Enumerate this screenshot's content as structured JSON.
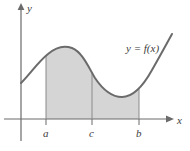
{
  "figure": {
    "name": "area-under-curve-diagram",
    "background_color": "#ffffff",
    "curve_color": "#6b6b6b",
    "axis_color": "#6b6b6b",
    "shade_color": "#d5d5d5",
    "divider_color": "#8a8a8a",
    "label_color": "#3d3d3d"
  },
  "axes": {
    "x_axis_label": "x",
    "y_axis_label": "y",
    "origin": {
      "x": 21,
      "y": 119
    },
    "x_axis_start": {
      "x": 4,
      "y": 119
    },
    "x_axis_end": {
      "x": 172,
      "y": 119
    },
    "y_axis_top": {
      "x": 21,
      "y": 6
    },
    "y_axis_bottom": {
      "x": 21,
      "y": 141
    }
  },
  "curve": {
    "label": "y = f(x)",
    "label_position": {
      "x": 126,
      "y": 51
    },
    "path": "M 21,83 C 30,74 38,62 48,54 C 56,47 64,45 72,48 C 82,52 88,66 95,78 C 103,90 112,97 122,97 C 132,97 142,88 152,70 C 160,56 166,45 172,34",
    "start_point": {
      "x": 21,
      "y": 83
    },
    "local_max": {
      "x": 62,
      "y": 46
    },
    "local_min": {
      "x": 124,
      "y": 97
    },
    "end_point": {
      "x": 172,
      "y": 34
    }
  },
  "shaded_region": {
    "description": "Region bounded by the curve, the x-axis, and the vertical lines at a and b",
    "left_bound_x": 46,
    "right_bound_x": 139,
    "baseline_y": 119,
    "path": "M 46,119 L 46,55 C 56,47 64,45 72,48 C 82,52 88,66 95,78 C 103,90 112,97 122,97 C 129,97 134,94 139,88 L 139,119 Z"
  },
  "divider": {
    "label": "c",
    "x": 92,
    "top_y": 73,
    "bottom_y": 119
  },
  "ticks": [
    {
      "label": "a",
      "x": 46,
      "label_x": 44,
      "label_y": 136
    },
    {
      "label": "c",
      "x": 92,
      "label_x": 90,
      "label_y": 136
    },
    {
      "label": "b",
      "x": 139,
      "label_x": 137,
      "label_y": 136
    }
  ]
}
